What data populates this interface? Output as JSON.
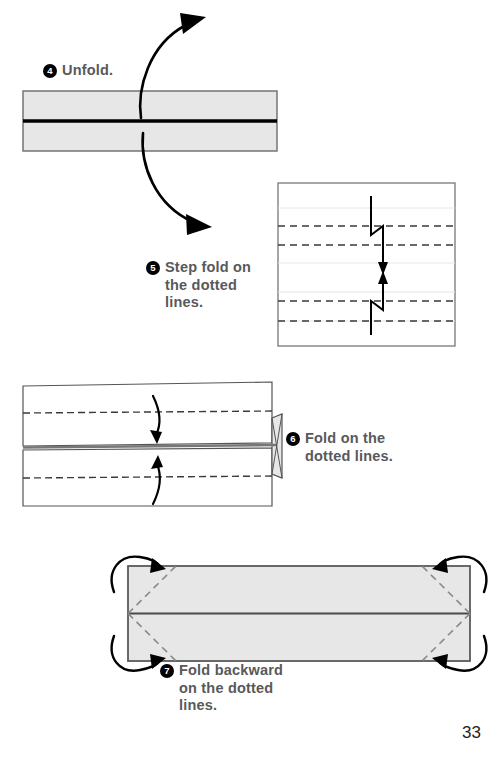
{
  "page": {
    "number": "33",
    "background_color": "#ffffff"
  },
  "colors": {
    "paper_gray": "#e7e7e7",
    "paper_white": "#ffffff",
    "outline": "#6b6b6b",
    "outline_dark": "#4a4a4a",
    "fold_line": "#000000",
    "dashed_line": "#3a3a3a",
    "faint_line": "#e2e2e2",
    "text": "#58595b",
    "bullet_bg": "#000000",
    "bullet_text": "#ffffff",
    "arrow": "#000000"
  },
  "steps": [
    {
      "id": "step-4",
      "number": "4",
      "text": "Unfold.",
      "lines": [
        "Unfold."
      ],
      "diagram": {
        "name": "unfold-band-diagram",
        "type": "folded-strip",
        "shape": "rectangle",
        "fill": "#e7e7e7",
        "center_fold_line": true,
        "arrows": [
          {
            "name": "unfold-arrow-up",
            "direction": "up-right"
          },
          {
            "name": "unfold-arrow-down",
            "direction": "down-right"
          }
        ]
      }
    },
    {
      "id": "step-5",
      "number": "5",
      "text": "Step fold on the dotted lines.",
      "lines": [
        "Step fold on",
        "the dotted",
        "lines."
      ],
      "diagram": {
        "name": "step-fold-square-diagram",
        "type": "square-sheet",
        "fill": "#ffffff",
        "dashed_line_count": 4,
        "faint_line_count": 4,
        "arrows": [
          {
            "name": "step-fold-arrow-down",
            "direction": "down",
            "style": "zigzag"
          },
          {
            "name": "step-fold-arrow-up",
            "direction": "up",
            "style": "zigzag"
          }
        ]
      }
    },
    {
      "id": "step-6",
      "number": "6",
      "text": "Fold on the dotted lines.",
      "lines": [
        "Fold on the",
        "dotted lines."
      ],
      "diagram": {
        "name": "fold-bands-diagram",
        "type": "two-bands",
        "fill": "#ffffff",
        "dashed_line_count": 2,
        "arrows": [
          {
            "name": "fold-arrow-down",
            "direction": "down"
          },
          {
            "name": "fold-arrow-up",
            "direction": "up"
          }
        ]
      }
    },
    {
      "id": "step-7",
      "number": "7",
      "text": "Fold backward on the dotted lines.",
      "lines": [
        "Fold backward",
        "on the dotted",
        "lines."
      ],
      "diagram": {
        "name": "fold-backward-rectangle-diagram",
        "type": "rectangle-sheet",
        "fill": "#e7e7e7",
        "center_fold_line": true,
        "corner_dashed_count": 4,
        "arrows": [
          {
            "name": "corner-arrow-top-left",
            "direction": "backward"
          },
          {
            "name": "corner-arrow-top-right",
            "direction": "backward"
          },
          {
            "name": "corner-arrow-bottom-left",
            "direction": "backward"
          },
          {
            "name": "corner-arrow-bottom-right",
            "direction": "backward"
          }
        ]
      }
    }
  ]
}
